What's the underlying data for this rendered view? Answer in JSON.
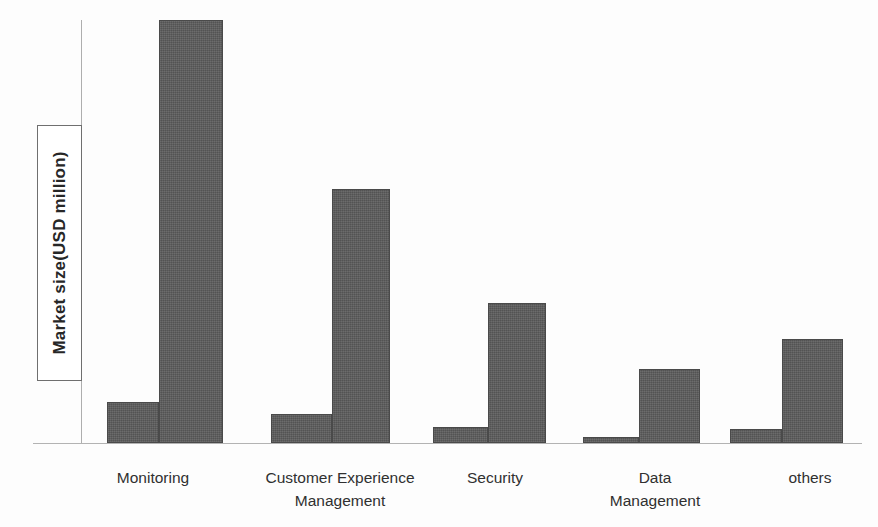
{
  "chart_data": {
    "type": "bar",
    "title": "",
    "subtitle": "",
    "xlabel": "",
    "ylabel": "Market size(USD million)",
    "categories": [
      "Monitoring",
      "Customer Experience\nManagement",
      "Security",
      "Data\nManagement",
      "others"
    ],
    "series": [
      {
        "name": "series-1",
        "values": [
          9.7,
          6.9,
          3.7,
          1.5,
          3.2
        ]
      },
      {
        "name": "series-2",
        "values": [
          100,
          60,
          33,
          17.6,
          24.5
        ]
      }
    ],
    "ylim": [
      0,
      100
    ],
    "grid": false,
    "legend": false,
    "axis_tick_labels": [],
    "colors": {
      "bar_fill": "#5b5b5b",
      "bar_border": "#4a4a4a",
      "axis_line": "#b3b3b3",
      "background": "#fdfdfd",
      "text": "#303030"
    }
  },
  "axis": {
    "y_title": "Market size(USD million)"
  },
  "categories": [
    {
      "id": "monitoring",
      "label": "Monitoring"
    },
    {
      "id": "customer-experience-management",
      "label": "Customer Experience\nManagement"
    },
    {
      "id": "security",
      "label": "Security"
    },
    {
      "id": "data-management",
      "label": "Data\nManagement"
    },
    {
      "id": "others",
      "label": "others"
    }
  ],
  "bars": [
    {
      "id": "monitoring-small",
      "value": 9.7,
      "height_pct": 9.7,
      "left_px": 26,
      "width_px": 52
    },
    {
      "id": "monitoring-large",
      "value": 100,
      "height_pct": 100,
      "left_px": 78,
      "width_px": 64
    },
    {
      "id": "cem-small",
      "value": 6.9,
      "height_pct": 6.9,
      "left_px": 190,
      "width_px": 61
    },
    {
      "id": "cem-large",
      "value": 60,
      "height_pct": 60,
      "left_px": 251,
      "width_px": 58
    },
    {
      "id": "security-small",
      "value": 3.7,
      "height_pct": 3.7,
      "left_px": 352,
      "width_px": 55
    },
    {
      "id": "security-large",
      "value": 33,
      "height_pct": 33,
      "left_px": 407,
      "width_px": 58
    },
    {
      "id": "datamgmt-small",
      "value": 1.5,
      "height_pct": 1.5,
      "left_px": 502,
      "width_px": 56
    },
    {
      "id": "datamgmt-large",
      "value": 17.6,
      "height_pct": 17.6,
      "left_px": 558,
      "width_px": 61
    },
    {
      "id": "others-small",
      "value": 3.2,
      "height_pct": 3.2,
      "left_px": 649,
      "width_px": 52
    },
    {
      "id": "others-large",
      "value": 24.5,
      "height_pct": 24.5,
      "left_px": 701,
      "width_px": 61
    }
  ],
  "label_positions": [
    {
      "left_px": 98,
      "width_px": 110
    },
    {
      "left_px": 240,
      "width_px": 200
    },
    {
      "left_px": 440,
      "width_px": 110
    },
    {
      "left_px": 580,
      "width_px": 150
    },
    {
      "left_px": 760,
      "width_px": 100
    }
  ]
}
